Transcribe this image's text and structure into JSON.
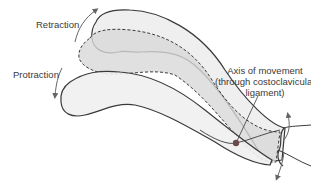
{
  "diagram": {
    "type": "anatomical-illustration",
    "labels": {
      "retraction": "Retraction",
      "protraction": "Protraction",
      "axis_line1": "Axis of movement",
      "axis_line2": "(through costoclavicular",
      "axis_line3": "ligament)"
    },
    "colors": {
      "outline": "#3a3a3a",
      "fill_light": "#efefef",
      "fill_dark": "#d8d8d8",
      "arrow": "#666666",
      "axis_dot": "#6b4a4a"
    }
  }
}
